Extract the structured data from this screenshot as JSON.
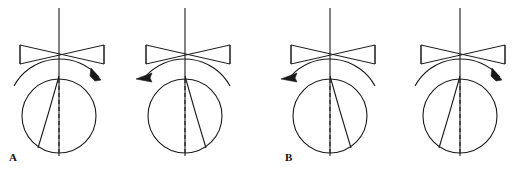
{
  "figure": {
    "width": 530,
    "height": 176,
    "background_color": "#ffffff",
    "stroke_color": "#1a1a1a"
  },
  "panels": [
    {
      "id": "A",
      "label": "A",
      "label_x": 9,
      "label_y": 152
    },
    {
      "id": "B",
      "label": "B",
      "label_x": 285,
      "label_y": 152
    }
  ],
  "diagrams": [
    {
      "id": "diagram-1",
      "panel": "A",
      "center_x": 59,
      "shaft": {
        "x": 59,
        "top_y": 8,
        "bottom_y": 156
      },
      "bowtie": {
        "left_x": 20,
        "right_x": 104,
        "top_y": 45,
        "bottom_y": 64,
        "waist_x": 62
      },
      "circle": {
        "cx": 59,
        "cy": 116,
        "r": 37
      },
      "dashed_line": {
        "x": 59,
        "top_y": 79,
        "bottom_y": 153
      },
      "chord": {
        "x1": 59,
        "y1": 76,
        "x2": 38,
        "y2": 148,
        "direction": "down-left"
      },
      "rotation": {
        "direction": "clockwise",
        "arrow_side": "right",
        "label": "clockwise-rotation-arrow"
      }
    },
    {
      "id": "diagram-2",
      "panel": "A",
      "center_x": 185,
      "shaft": {
        "x": 185,
        "top_y": 8,
        "bottom_y": 156
      },
      "bowtie": {
        "left_x": 146,
        "right_x": 230,
        "top_y": 45,
        "bottom_y": 64,
        "waist_x": 188
      },
      "circle": {
        "cx": 185,
        "cy": 116,
        "r": 37
      },
      "dashed_line": {
        "x": 185,
        "top_y": 79,
        "bottom_y": 153
      },
      "chord": {
        "x1": 185,
        "y1": 76,
        "x2": 206,
        "y2": 148,
        "direction": "down-right"
      },
      "rotation": {
        "direction": "counter-clockwise",
        "arrow_side": "left",
        "label": "counter-clockwise-rotation-arrow"
      }
    },
    {
      "id": "diagram-3",
      "panel": "B",
      "center_x": 330,
      "shaft": {
        "x": 330,
        "top_y": 8,
        "bottom_y": 156
      },
      "bowtie": {
        "left_x": 291,
        "right_x": 375,
        "top_y": 45,
        "bottom_y": 64,
        "waist_x": 333
      },
      "circle": {
        "cx": 330,
        "cy": 116,
        "r": 37
      },
      "dashed_line": {
        "x": 330,
        "top_y": 79,
        "bottom_y": 153
      },
      "chord": {
        "x1": 330,
        "y1": 76,
        "x2": 351,
        "y2": 148,
        "direction": "down-right"
      },
      "rotation": {
        "direction": "counter-clockwise",
        "arrow_side": "left",
        "label": "counter-clockwise-rotation-arrow"
      }
    },
    {
      "id": "diagram-4",
      "panel": "B",
      "center_x": 460,
      "shaft": {
        "x": 460,
        "top_y": 8,
        "bottom_y": 156
      },
      "bowtie": {
        "left_x": 421,
        "right_x": 505,
        "top_y": 45,
        "bottom_y": 64,
        "waist_x": 463
      },
      "circle": {
        "cx": 460,
        "cy": 116,
        "r": 37
      },
      "dashed_line": {
        "x": 460,
        "top_y": 79,
        "bottom_y": 153
      },
      "chord": {
        "x1": 460,
        "y1": 76,
        "x2": 439,
        "y2": 148,
        "direction": "down-left"
      },
      "rotation": {
        "direction": "clockwise",
        "arrow_side": "right",
        "label": "clockwise-rotation-arrow"
      }
    }
  ]
}
